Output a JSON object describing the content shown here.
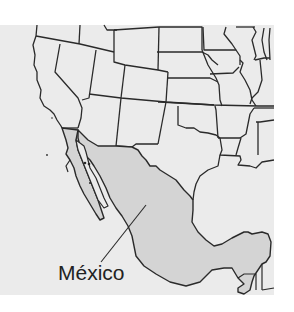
{
  "map": {
    "region": "Southwestern United States and Mexico",
    "highlighted_country": "Mexico",
    "labels": [
      {
        "text": "México",
        "target": "Mexico"
      }
    ],
    "colors": {
      "page_background": "#ffffff",
      "map_background": "#ebebeb",
      "land": "#ebebeb",
      "highlight_fill": "#d4d4d4",
      "border": "#2a2a2a",
      "label_text": "#222222"
    }
  }
}
